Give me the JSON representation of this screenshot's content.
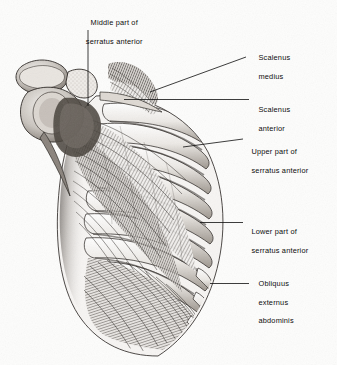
{
  "figure": {
    "kind": "anatomical-illustration",
    "technique": "monochrome halftone engraving",
    "background_color": "#fdfdfc",
    "ink_color": "#111111"
  },
  "labels": [
    {
      "id": "middle-serratus",
      "line1": "Middle part of",
      "line2": "serratus anterior",
      "x": 60,
      "y": 9,
      "width": 104,
      "align": "center",
      "leader": {
        "type": "vertical",
        "x1": 88,
        "y1": 30,
        "x2": 88,
        "y2": 106
      }
    },
    {
      "id": "scalenus-medius",
      "line1": "Scalenus",
      "line2": "medius",
      "x": 254,
      "y": 44,
      "width": 80,
      "align": "left",
      "leader": {
        "type": "diagonal",
        "x1": 150,
        "y1": 92,
        "x2": 246,
        "y2": 57
      }
    },
    {
      "id": "scalenus-anterior",
      "line1": "Scalenus",
      "line2": "anterior",
      "x": 254,
      "y": 96,
      "width": 80,
      "align": "left",
      "leader": {
        "type": "horizontal",
        "x1": 124,
        "y1": 99.5,
        "x2": 249,
        "y2": 99.5
      }
    },
    {
      "id": "upper-serratus",
      "line1": "Upper part of",
      "line2": "serratus anterior",
      "x": 247,
      "y": 138,
      "width": 88,
      "align": "left",
      "leader": {
        "type": "diagonal",
        "x1": 183,
        "y1": 147,
        "x2": 243,
        "y2": 139
      }
    },
    {
      "id": "lower-serratus",
      "line1": "Lower part of",
      "line2": "serratus anterior",
      "x": 247,
      "y": 218,
      "width": 88,
      "align": "left",
      "leader": {
        "type": "horizontal",
        "x1": 200,
        "y1": 222.5,
        "x2": 243,
        "y2": 222.5
      }
    },
    {
      "id": "obliquus-externus",
      "line1": "Obliquus",
      "line2": "externus",
      "line3": "abdominis",
      "x": 254,
      "y": 270,
      "width": 80,
      "align": "left",
      "leader": {
        "type": "horizontal",
        "x1": 210,
        "y1": 283.5,
        "x2": 249,
        "y2": 283.5
      }
    }
  ],
  "structures": [
    {
      "name": "scapula",
      "region": "upper-left"
    },
    {
      "name": "clavicle",
      "region": "upper-left"
    },
    {
      "name": "humeral-head",
      "region": "upper-left"
    },
    {
      "name": "ribs",
      "count": 10,
      "region": "thorax"
    },
    {
      "name": "serratus-anterior-digitations",
      "count": 9,
      "region": "lateral-thorax"
    },
    {
      "name": "obliquus-externus-abdominis",
      "region": "lower-thorax"
    },
    {
      "name": "scalenus-medius",
      "region": "neck"
    },
    {
      "name": "scalenus-anterior",
      "region": "neck"
    }
  ]
}
